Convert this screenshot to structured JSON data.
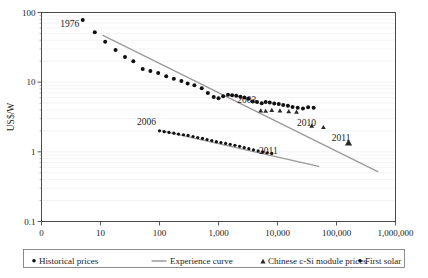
{
  "chart_data": {
    "type": "scatter",
    "title": "",
    "subtitle": "",
    "xlabel": "",
    "ylabel": "US$/W",
    "xscale": "log",
    "yscale": "log",
    "xlim": [
      1,
      1000000
    ],
    "ylim": [
      0.1,
      100
    ],
    "grid": true,
    "legend_position": "bottom",
    "x_tick_labels": [
      "0",
      "10",
      "100",
      "1,000",
      "10,000",
      "100,000",
      "1,000,000"
    ],
    "x_tick_values": [
      1,
      10,
      100,
      1000,
      10000,
      100000,
      1000000
    ],
    "y_tick_labels": [
      "100",
      "10",
      "1",
      "0.1"
    ],
    "y_tick_values": [
      100,
      10,
      1,
      0.1
    ],
    "annotations": [
      {
        "text": "1976",
        "x": 3.0,
        "y": 62.0,
        "note": "start of historical price series"
      },
      {
        "text": "2003",
        "x": 3000.0,
        "y": 5.1,
        "note": "start of chinese c-Si module series"
      },
      {
        "text": "2010",
        "x": 31000.0,
        "y": 2.35,
        "note": "chinese c-Si module marker"
      },
      {
        "text": "2011",
        "x": 120000.0,
        "y": 1.42,
        "note": "chinese c-Si module final marker"
      },
      {
        "text": "2006",
        "x": 60.0,
        "y": 2.45,
        "note": "start of first solar series"
      },
      {
        "text": "2011",
        "x": 7000.0,
        "y": 0.93,
        "note": "end of first solar series"
      }
    ],
    "series": [
      {
        "name": "Historical prices",
        "marker": "circle",
        "color": "#111111",
        "points": [
          [
            5,
            78
          ],
          [
            8,
            52
          ],
          [
            12,
            38
          ],
          [
            18,
            29
          ],
          [
            26,
            23
          ],
          [
            36,
            20
          ],
          [
            52,
            15.5
          ],
          [
            70,
            14.5
          ],
          [
            95,
            13.5
          ],
          [
            130,
            12.2
          ],
          [
            175,
            11.2
          ],
          [
            235,
            10.4
          ],
          [
            300,
            9.6
          ],
          [
            390,
            9.0
          ],
          [
            520,
            8.2
          ],
          [
            660,
            7.0
          ],
          [
            830,
            6.1
          ],
          [
            1000,
            5.9
          ],
          [
            1200,
            6.3
          ],
          [
            1450,
            6.6
          ],
          [
            1700,
            6.5
          ],
          [
            2000,
            6.4
          ],
          [
            2350,
            6.2
          ],
          [
            2750,
            6.0
          ],
          [
            3200,
            5.8
          ],
          [
            3800,
            5.3
          ],
          [
            4500,
            5.2
          ],
          [
            5400,
            5.0
          ],
          [
            6300,
            5.2
          ],
          [
            7400,
            5.1
          ],
          [
            8800,
            4.95
          ],
          [
            10500,
            4.85
          ],
          [
            12500,
            4.7
          ],
          [
            15000,
            4.6
          ],
          [
            18000,
            4.4
          ],
          [
            22000,
            4.3
          ],
          [
            27000,
            4.2
          ],
          [
            33000,
            4.35
          ],
          [
            41000,
            4.3
          ]
        ]
      },
      {
        "name": "Chinese c-Si module prices",
        "marker": "triangle",
        "color": "#2b2b2b",
        "points": [
          [
            5200,
            3.9
          ],
          [
            6300,
            3.85
          ],
          [
            8000,
            3.95
          ],
          [
            11000,
            3.9
          ],
          [
            15500,
            3.8
          ],
          [
            21000,
            3.75
          ],
          [
            38000,
            2.35
          ],
          [
            60000,
            2.25
          ],
          [
            160000,
            1.35
          ]
        ]
      },
      {
        "name": "First solar",
        "marker": "circle",
        "color": "#111111",
        "points": [
          [
            100,
            2.0
          ],
          [
            120,
            1.95
          ],
          [
            145,
            1.9
          ],
          [
            175,
            1.85
          ],
          [
            210,
            1.8
          ],
          [
            255,
            1.76
          ],
          [
            305,
            1.72
          ],
          [
            370,
            1.66
          ],
          [
            445,
            1.6
          ],
          [
            535,
            1.56
          ],
          [
            640,
            1.5
          ],
          [
            770,
            1.45
          ],
          [
            920,
            1.4
          ],
          [
            1100,
            1.36
          ],
          [
            1320,
            1.32
          ],
          [
            1580,
            1.28
          ],
          [
            1900,
            1.24
          ],
          [
            2280,
            1.2
          ],
          [
            2730,
            1.15
          ],
          [
            3270,
            1.11
          ],
          [
            3920,
            1.07
          ],
          [
            4700,
            1.03
          ],
          [
            5600,
            1.0
          ],
          [
            6700,
            0.97
          ],
          [
            8000,
            0.95
          ]
        ]
      },
      {
        "name": "Experience curve",
        "marker": "line",
        "color": "#9a9a9a",
        "lines": [
          {
            "x1": 11,
            "y1": 47,
            "x2": 500000,
            "y2": 0.52,
            "note": "historical experience curve"
          },
          {
            "x1": 110,
            "y1": 2.0,
            "x2": 50000,
            "y2": 0.62,
            "note": "first solar experience curve"
          }
        ]
      }
    ]
  },
  "axis": {
    "y_title": "US$/W"
  },
  "legend": {
    "items": [
      {
        "label": "Historical prices",
        "marker": "circle"
      },
      {
        "label": "Experience curve",
        "marker": "line"
      },
      {
        "label": "Chinese c-Si module prices",
        "marker": "triangle"
      },
      {
        "label": "First solar",
        "marker": "circle"
      }
    ]
  }
}
